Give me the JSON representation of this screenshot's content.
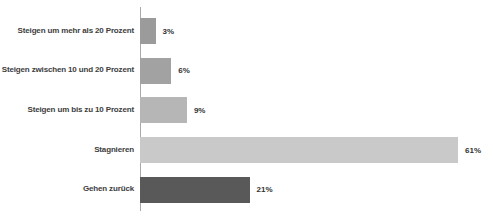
{
  "chart_data": {
    "type": "bar",
    "orientation": "horizontal",
    "title": "",
    "xlabel": "",
    "ylabel": "",
    "categories": [
      "Steigen um mehr als 20 Prozent",
      "Steigen zwischen 10 und 20 Prozent",
      "Steigen um bis zu 10 Prozent",
      "Stagnieren",
      "Gehen zurück"
    ],
    "values": [
      3,
      6,
      9,
      61,
      21
    ],
    "value_labels": [
      "3%",
      "6%",
      "9%",
      "61%",
      "21%"
    ],
    "bar_colors": [
      "#9b9b9b",
      "#a2a2a2",
      "#b6b6b6",
      "#c9c9c9",
      "#595959"
    ],
    "axis_color": "#aaaaaa",
    "xlim": [
      0,
      65
    ],
    "grid": false,
    "legend": "none"
  }
}
